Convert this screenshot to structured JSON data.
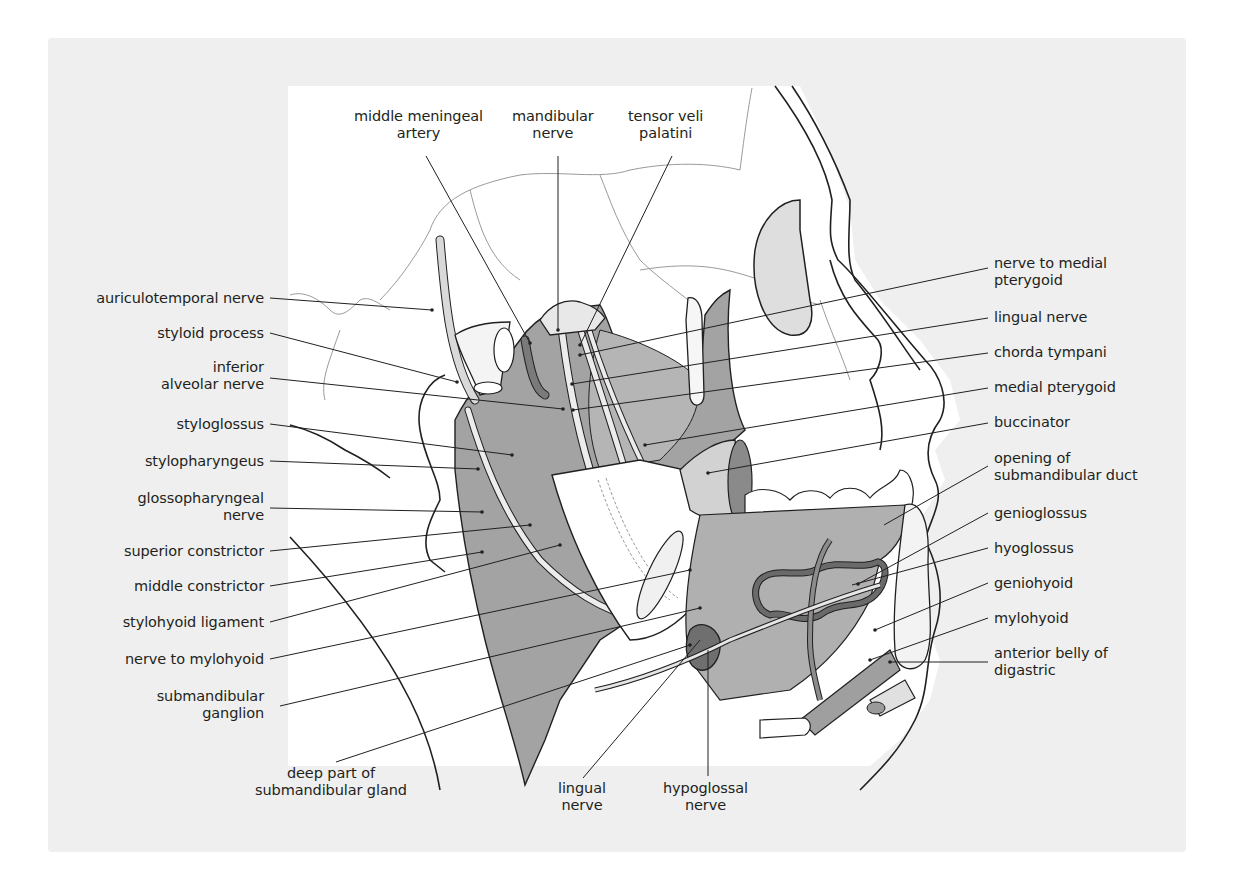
{
  "figure": {
    "colors": {
      "panel_bg": "#efefef",
      "inset_bg": "#ffffff",
      "muscle": "#a3a3a3",
      "muscle_light": "#c4c4c4",
      "gland": "#6f6f6f",
      "nerve": "#e6e6e6",
      "line": "#231f20",
      "suture": "#8a8a8a"
    }
  },
  "labels": {
    "top": [
      {
        "id": "middle-meningeal-artery",
        "lines": [
          "middle meningeal",
          "artery"
        ]
      },
      {
        "id": "mandibular-nerve",
        "lines": [
          "mandibular",
          "nerve"
        ]
      },
      {
        "id": "tensor-veli-palatini",
        "lines": [
          "tensor veli",
          "palatini"
        ]
      }
    ],
    "left": [
      {
        "id": "auriculotemporal-nerve",
        "lines": [
          "auriculotemporal nerve"
        ]
      },
      {
        "id": "styloid-process",
        "lines": [
          "styloid process"
        ]
      },
      {
        "id": "inferior-alveolar-nerve",
        "lines": [
          "inferior",
          "alveolar nerve"
        ]
      },
      {
        "id": "styloglossus",
        "lines": [
          "styloglossus"
        ]
      },
      {
        "id": "stylopharyngeus",
        "lines": [
          "stylopharyngeus"
        ]
      },
      {
        "id": "glossopharyngeal-nerve",
        "lines": [
          "glossopharyngeal",
          "nerve"
        ]
      },
      {
        "id": "superior-constrictor",
        "lines": [
          "superior constrictor"
        ]
      },
      {
        "id": "middle-constrictor",
        "lines": [
          "middle constrictor"
        ]
      },
      {
        "id": "stylohyoid-ligament",
        "lines": [
          "stylohyoid ligament"
        ]
      },
      {
        "id": "nerve-to-mylohyoid",
        "lines": [
          "nerve to mylohyoid"
        ]
      },
      {
        "id": "submandibular-ganglion",
        "lines": [
          "submandibular",
          "ganglion"
        ]
      }
    ],
    "bottom": [
      {
        "id": "deep-part-of-submandibular-gland",
        "lines": [
          "deep part of",
          "submandibular gland"
        ]
      },
      {
        "id": "lingual-nerve-bottom",
        "lines": [
          "lingual",
          "nerve"
        ]
      },
      {
        "id": "hypoglossal-nerve",
        "lines": [
          "hypoglossal",
          "nerve"
        ]
      }
    ],
    "right": [
      {
        "id": "nerve-to-medial-pterygoid",
        "lines": [
          "nerve to medial",
          "pterygoid"
        ]
      },
      {
        "id": "lingual-nerve",
        "lines": [
          "lingual nerve"
        ]
      },
      {
        "id": "chorda-tympani",
        "lines": [
          "chorda tympani"
        ]
      },
      {
        "id": "medial-pterygoid",
        "lines": [
          "medial pterygoid"
        ]
      },
      {
        "id": "buccinator",
        "lines": [
          "buccinator"
        ]
      },
      {
        "id": "opening-of-submandibular-duct",
        "lines": [
          "opening of",
          "submandibular duct"
        ]
      },
      {
        "id": "genioglossus",
        "lines": [
          "genioglossus"
        ]
      },
      {
        "id": "hyoglossus",
        "lines": [
          "hyoglossus"
        ]
      },
      {
        "id": "geniohyoid",
        "lines": [
          "geniohyoid"
        ]
      },
      {
        "id": "mylohyoid",
        "lines": [
          "mylohyoid"
        ]
      },
      {
        "id": "anterior-belly-of-digastric",
        "lines": [
          "anterior belly of",
          "digastric"
        ]
      }
    ]
  }
}
